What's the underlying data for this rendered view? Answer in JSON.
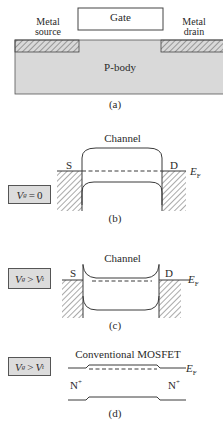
{
  "panel_a": {
    "gate_label": "Gate",
    "source_label_line1": "Metal",
    "source_label_line2": "source",
    "drain_label_line1": "Metal",
    "drain_label_line2": "drain",
    "body_label": "P-body",
    "caption": "(a)"
  },
  "panel_b": {
    "channel_label": "Channel",
    "source_label": "S",
    "drain_label": "D",
    "fermi_label": "E",
    "fermi_sub": "F",
    "condition": {
      "v": "V",
      "v_sub": "g",
      "op": "=",
      "rhs": "0",
      "rhs_sub": ""
    },
    "caption": "(b)"
  },
  "panel_c": {
    "channel_label": "Channel",
    "source_label": "S",
    "drain_label": "D",
    "fermi_label": "E",
    "fermi_sub": "F",
    "condition": {
      "v": "V",
      "v_sub": "g",
      "op": ">",
      "rhs": "V",
      "rhs_sub": "t"
    },
    "caption": "(c)"
  },
  "panel_d": {
    "title": "Conventional MOSFET",
    "source_label": "N",
    "source_sup": "+",
    "drain_label": "N",
    "drain_sup": "+",
    "fermi_label": "E",
    "fermi_sub": "F",
    "condition": {
      "v": "V",
      "v_sub": "g",
      "op": ">",
      "rhs": "V",
      "rhs_sub": "t"
    },
    "caption": "(d)"
  },
  "colors": {
    "line": "#3a3a3a",
    "body_fill": "#d9d9d9",
    "box_fill": "#dcdcdc",
    "background": "#ffffff"
  }
}
